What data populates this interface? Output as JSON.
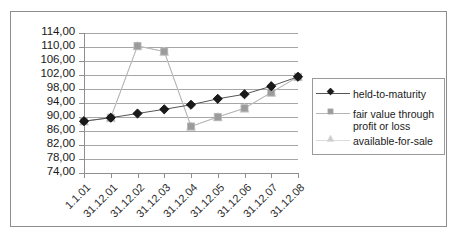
{
  "chart_data": {
    "type": "line",
    "title": "",
    "subtitle": "",
    "xlabel": "",
    "ylabel": "",
    "categories": [
      "1.1.01",
      "31.12.01",
      "31.12.02",
      "31.12.03",
      "31.12.04",
      "31.12.05",
      "31.12.06",
      "31.12.07",
      "31.12.08"
    ],
    "ylim": [
      74.0,
      114.0
    ],
    "ytick_labels": [
      "114,00",
      "110,00",
      "106,00",
      "102,00",
      "98,00",
      "94,00",
      "90,00",
      "86,00",
      "82,00",
      "78,00",
      "74,00"
    ],
    "ytick_values": [
      114.0,
      110.0,
      106.0,
      102.0,
      98.0,
      94.0,
      90.0,
      86.0,
      82.0,
      78.0,
      74.0
    ],
    "grid": true,
    "grid_axis": "y",
    "legend_position": "right",
    "series": [
      {
        "name": "held-to-maturity",
        "marker": "diamond",
        "color": "#1a1a1a",
        "line_color": "#555555",
        "values": [
          88.8,
          89.8,
          91.0,
          92.2,
          93.5,
          95.2,
          96.5,
          98.8,
          101.5
        ]
      },
      {
        "name": "fair value through profit or loss",
        "marker": "square",
        "color": "#9b9b9b",
        "line_color": "#b5b5b5",
        "values": [
          88.8,
          89.8,
          110.3,
          108.7,
          87.3,
          90.0,
          92.5,
          97.0,
          101.5
        ]
      },
      {
        "name": "available-for-sale",
        "marker": "triangle",
        "color": "#cdcdcd",
        "line_color": "#dcdcdc",
        "values": [
          88.8,
          89.8,
          110.3,
          108.7,
          87.3,
          90.0,
          92.5,
          97.0,
          101.5
        ]
      }
    ]
  },
  "legend": {
    "entries": [
      {
        "label": "held-to-maturity"
      },
      {
        "label": "fair value through\nprofit or loss"
      },
      {
        "label": "available-for-sale"
      }
    ]
  },
  "colors": {
    "axis": "#8f8f8f",
    "grid": "#a6a6a6",
    "frame": "#8d8d8d",
    "text": "#1a1a1a",
    "background": "#ffffff"
  }
}
